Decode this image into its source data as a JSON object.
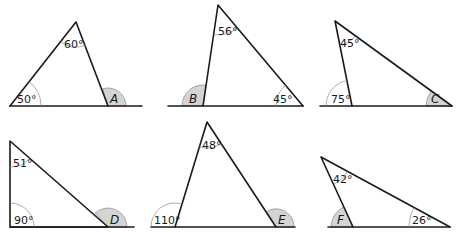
{
  "figure": {
    "triangles": [
      {
        "id": "A",
        "given_angles": [
          "60°",
          "50°"
        ],
        "unknown_label": "A"
      },
      {
        "id": "B",
        "given_angles": [
          "56°",
          "45°"
        ],
        "unknown_label": "B"
      },
      {
        "id": "C",
        "given_angles": [
          "45°",
          "75°"
        ],
        "unknown_label": "C"
      },
      {
        "id": "D",
        "given_angles": [
          "51°",
          "90°"
        ],
        "unknown_label": "D"
      },
      {
        "id": "E",
        "given_angles": [
          "48°",
          "110°"
        ],
        "unknown_label": "E"
      },
      {
        "id": "F",
        "given_angles": [
          "42°",
          "26°"
        ],
        "unknown_label": "F"
      }
    ]
  },
  "colors": {
    "line": "#1a1a1a",
    "arc": "#8a8a8a",
    "shade": "#d4d4d4"
  }
}
